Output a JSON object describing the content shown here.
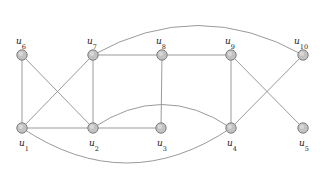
{
  "figure": {
    "type": "graph-diagram",
    "width": 326,
    "height": 178,
    "background_color": "#ffffff",
    "node_fill_color": "#c2c2c2",
    "node_stroke_color": "#7d7d7d",
    "edge_color": "#9a9a9a",
    "label_color": "#1a1a1a",
    "node_radius": 5.2
  },
  "nodes": [
    {
      "id": "u1",
      "base": "u",
      "subscript": "1",
      "x": 22,
      "y": 128,
      "label_x": 19,
      "label_y": 146,
      "label": "u1"
    },
    {
      "id": "u2",
      "base": "u",
      "subscript": "2",
      "x": 93,
      "y": 128,
      "label_x": 89,
      "label_y": 146,
      "label": "u2"
    },
    {
      "id": "u3",
      "base": "u",
      "subscript": "3",
      "x": 161,
      "y": 128,
      "label_x": 157,
      "label_y": 146,
      "label": "u3"
    },
    {
      "id": "u4",
      "base": "u",
      "subscript": "4",
      "x": 231,
      "y": 128,
      "label_x": 227,
      "label_y": 146,
      "label": "u4"
    },
    {
      "id": "u5",
      "base": "u",
      "subscript": "5",
      "x": 303,
      "y": 128,
      "label_x": 299,
      "label_y": 146,
      "label": "u5"
    },
    {
      "id": "u6",
      "base": "u",
      "subscript": "6",
      "x": 22,
      "y": 55,
      "label_x": 16,
      "label_y": 44,
      "label": "u6"
    },
    {
      "id": "u7",
      "base": "u",
      "subscript": "7",
      "x": 93,
      "y": 55,
      "label_x": 87,
      "label_y": 44,
      "label": "u7"
    },
    {
      "id": "u8",
      "base": "u",
      "subscript": "8",
      "x": 162,
      "y": 55,
      "label_x": 156,
      "label_y": 44,
      "label": "u8"
    },
    {
      "id": "u9",
      "base": "u",
      "subscript": "9",
      "x": 231,
      "y": 55,
      "label_x": 225,
      "label_y": 44,
      "label": "u9"
    },
    {
      "id": "u10",
      "base": "u",
      "subscript": "10",
      "x": 303,
      "y": 55,
      "label_x": 294,
      "label_y": 44,
      "label": "u10"
    }
  ],
  "edges": [
    {
      "id": "e-u6-u1",
      "from": "u6",
      "to": "u1",
      "shape": "line",
      "path": "M 22 55 L 22 128"
    },
    {
      "id": "e-u6-u2",
      "from": "u6",
      "to": "u2",
      "shape": "line",
      "path": "M 22 55 L 93 128"
    },
    {
      "id": "e-u7-u1",
      "from": "u7",
      "to": "u1",
      "shape": "line",
      "path": "M 93 55 L 22 128"
    },
    {
      "id": "e-u7-u2",
      "from": "u7",
      "to": "u2",
      "shape": "line",
      "path": "M 93 55 L 93 128"
    },
    {
      "id": "e-u7-u8",
      "from": "u7",
      "to": "u8",
      "shape": "line",
      "path": "M 93 55 L 162 55"
    },
    {
      "id": "e-u8-u9",
      "from": "u8",
      "to": "u9",
      "shape": "line",
      "path": "M 162 55 L 231 55"
    },
    {
      "id": "e-u8-u3",
      "from": "u8",
      "to": "u3",
      "shape": "line",
      "path": "M 162 55 L 161 128"
    },
    {
      "id": "e-u9-u4",
      "from": "u9",
      "to": "u4",
      "shape": "line",
      "path": "M 231 55 L 231 128"
    },
    {
      "id": "e-u9-u5",
      "from": "u9",
      "to": "u5",
      "shape": "line",
      "path": "M 231 55 L 303 128"
    },
    {
      "id": "e-u10-u4",
      "from": "u10",
      "to": "u4",
      "shape": "line",
      "path": "M 303 55 L 231 128"
    },
    {
      "id": "e-u1-u2",
      "from": "u1",
      "to": "u2",
      "shape": "line",
      "path": "M 22 128 L 93 128"
    },
    {
      "id": "e-u2-u3",
      "from": "u2",
      "to": "u3",
      "shape": "line",
      "path": "M 93 128 L 161 128"
    },
    {
      "id": "e-u7-u10",
      "from": "u7",
      "to": "u10",
      "shape": "curve",
      "path": "M 93 55 Q 198 -4 303 55"
    },
    {
      "id": "e-u2-u4",
      "from": "u2",
      "to": "u4",
      "shape": "curve",
      "path": "M 93 128 Q 162 81 231 128"
    },
    {
      "id": "e-u1-u4",
      "from": "u1",
      "to": "u4",
      "shape": "curve",
      "path": "M 22 128 Q 127 198 231 128"
    }
  ],
  "adjacency_summary": {
    "u1": [
      "u6",
      "u7",
      "u2",
      "u4"
    ],
    "u2": [
      "u6",
      "u7",
      "u1",
      "u3",
      "u4"
    ],
    "u3": [
      "u2",
      "u8"
    ],
    "u4": [
      "u9",
      "u10",
      "u2",
      "u1"
    ],
    "u5": [
      "u9"
    ],
    "u6": [
      "u1",
      "u2"
    ],
    "u7": [
      "u1",
      "u2",
      "u8",
      "u10"
    ],
    "u8": [
      "u7",
      "u9",
      "u3"
    ],
    "u9": [
      "u8",
      "u4",
      "u5"
    ],
    "u10": [
      "u7",
      "u4"
    ]
  }
}
